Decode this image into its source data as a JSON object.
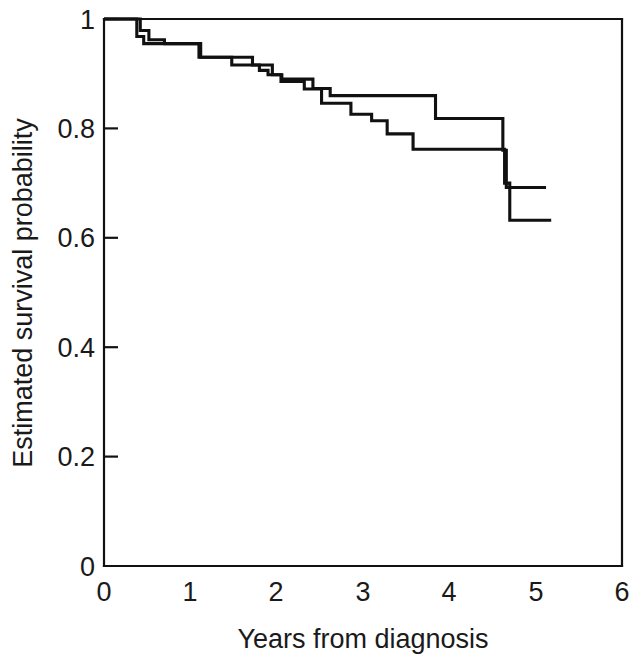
{
  "chart_data": {
    "type": "line",
    "title": "",
    "subtitle": "",
    "xlabel": "Years from diagnosis",
    "ylabel": "Estimated survival probability",
    "xlim": [
      0,
      6
    ],
    "ylim": [
      0,
      1
    ],
    "xticks": [
      0,
      1,
      2,
      3,
      4,
      5,
      6
    ],
    "xtick_labels": [
      "0",
      "1",
      "2",
      "3",
      "4",
      "5",
      "6"
    ],
    "yticks": [
      0,
      0.2,
      0.4,
      0.6,
      0.8,
      1
    ],
    "ytick_labels": [
      "0",
      "0.2",
      "0.4",
      "0.6",
      "0.8",
      "1"
    ],
    "grid": false,
    "legend": false,
    "legend_position": "none",
    "step_style": "post",
    "annotations": [],
    "series": [
      {
        "name": "curve-1",
        "color": "#111111",
        "x": [
          0.0,
          0.42,
          0.42,
          0.52,
          0.52,
          0.7,
          0.7,
          1.1,
          1.1,
          1.72,
          1.72,
          1.95,
          1.95,
          2.06,
          2.06,
          2.42,
          2.42,
          2.62,
          2.62,
          3.84,
          3.84,
          4.62,
          4.62,
          4.66,
          4.66,
          5.12
        ],
        "y": [
          1.0,
          1.0,
          0.979,
          0.979,
          0.962,
          0.962,
          0.955,
          0.955,
          0.93,
          0.93,
          0.916,
          0.916,
          0.898,
          0.898,
          0.89,
          0.89,
          0.873,
          0.873,
          0.86,
          0.86,
          0.818,
          0.818,
          0.76,
          0.76,
          0.692,
          0.692
        ]
      },
      {
        "name": "curve-2",
        "color": "#111111",
        "x": [
          0.0,
          0.38,
          0.38,
          0.46,
          0.46,
          1.12,
          1.12,
          1.48,
          1.48,
          1.8,
          1.8,
          1.9,
          1.9,
          2.05,
          2.05,
          2.32,
          2.32,
          2.52,
          2.52,
          2.86,
          2.86,
          3.1,
          3.1,
          3.28,
          3.28,
          3.58,
          3.58,
          4.64,
          4.64,
          4.7,
          4.7,
          5.18
        ],
        "y": [
          1.0,
          1.0,
          0.968,
          0.968,
          0.955,
          0.955,
          0.93,
          0.93,
          0.916,
          0.916,
          0.906,
          0.906,
          0.898,
          0.898,
          0.886,
          0.886,
          0.872,
          0.872,
          0.846,
          0.846,
          0.826,
          0.826,
          0.814,
          0.814,
          0.79,
          0.79,
          0.762,
          0.762,
          0.7,
          0.7,
          0.632,
          0.632
        ]
      }
    ]
  },
  "figure": {
    "x_axis_label": "Years from diagnosis",
    "y_axis_label": "Estimated survival probability"
  }
}
